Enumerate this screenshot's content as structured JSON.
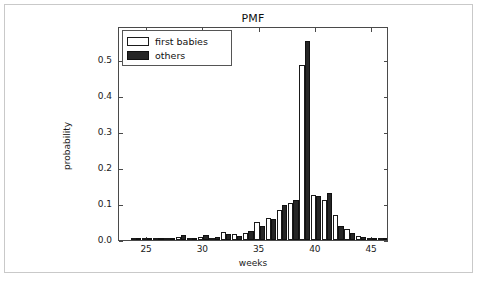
{
  "chart_data": {
    "type": "bar",
    "title": "PMF",
    "xlabel": "weeks",
    "ylabel": "probability",
    "xlim": [
      22.5,
      46.5
    ],
    "ylim": [
      0.0,
      0.595
    ],
    "grid": false,
    "legend_position": "upper left",
    "xticks": [
      25,
      30,
      35,
      40,
      45
    ],
    "xtick_labels": [
      "25",
      "30",
      "35",
      "40",
      "45"
    ],
    "yticks": [
      0.0,
      0.1,
      0.2,
      0.3,
      0.4,
      0.5
    ],
    "ytick_labels": [
      "0.0",
      "0.1",
      "0.2",
      "0.3",
      "0.4",
      "0.5"
    ],
    "categories": [
      24,
      25,
      26,
      27,
      28,
      29,
      30,
      31,
      32,
      33,
      34,
      35,
      36,
      37,
      38,
      39,
      40,
      41,
      42,
      43,
      44,
      45,
      46
    ],
    "series": [
      {
        "name": "first babies",
        "color": "#ffffff",
        "edge_color": "#1a1a1a",
        "values": [
          0.002,
          0.002,
          0.003,
          0.003,
          0.008,
          0.004,
          0.007,
          0.006,
          0.023,
          0.016,
          0.02,
          0.05,
          0.062,
          0.083,
          0.104,
          0.487,
          0.126,
          0.11,
          0.07,
          0.032,
          0.012,
          0.005,
          0.002
        ]
      },
      {
        "name": "others",
        "color": "#262626",
        "edge_color": "#101010",
        "values": [
          0.002,
          0.002,
          0.005,
          0.003,
          0.013,
          0.005,
          0.014,
          0.007,
          0.018,
          0.011,
          0.025,
          0.04,
          0.058,
          0.097,
          0.11,
          0.552,
          0.122,
          0.132,
          0.04,
          0.02,
          0.009,
          0.004,
          0.002
        ]
      }
    ]
  },
  "legend": {
    "items": [
      {
        "label": "first babies",
        "swatch": "first"
      },
      {
        "label": "others",
        "swatch": "others"
      }
    ]
  }
}
